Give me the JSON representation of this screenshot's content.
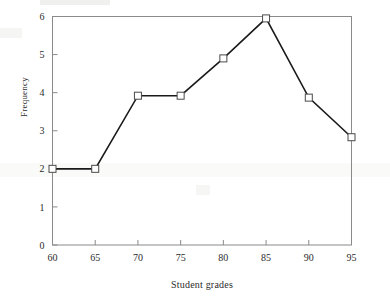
{
  "chart_data": {
    "type": "line",
    "title": "",
    "subtitle": "",
    "xlabel": "Student grades",
    "ylabel": "Frequency",
    "x": [
      60,
      65,
      70,
      75,
      80,
      85,
      90,
      95
    ],
    "values": [
      2.0,
      2.0,
      3.92,
      3.92,
      4.9,
      5.95,
      3.87,
      2.83
    ],
    "series": [
      {
        "name": "Frequency",
        "x": [
          60,
          65,
          70,
          75,
          80,
          85,
          90,
          95
        ],
        "values": [
          2.0,
          2.0,
          3.92,
          3.92,
          4.9,
          5.95,
          3.87,
          2.83
        ]
      }
    ],
    "xlim": [
      60,
      95
    ],
    "ylim": [
      0,
      6
    ],
    "xticks": [
      60,
      65,
      70,
      75,
      80,
      85,
      90,
      95
    ],
    "yticks": [
      0,
      1,
      2,
      3,
      4,
      5,
      6
    ],
    "xtick_labels": [
      "60",
      "65",
      "70",
      "75",
      "80",
      "85",
      "90",
      "95"
    ],
    "ytick_labels": [
      "0",
      "1",
      "2",
      "3",
      "4",
      "5",
      "6"
    ],
    "grid": false,
    "legend": false,
    "legend_position": "none",
    "marker": "open-square",
    "line_color": "#1a1a1a",
    "marker_face_color": "#ffffff",
    "marker_edge_color": "#4a4a4a",
    "axis_color": "#808080",
    "text_color": "#2b2b2b",
    "background": "#ffffff",
    "annotations": []
  },
  "axes": {
    "y_axis_title": "Frequency",
    "x_axis_title": "Student grades"
  }
}
